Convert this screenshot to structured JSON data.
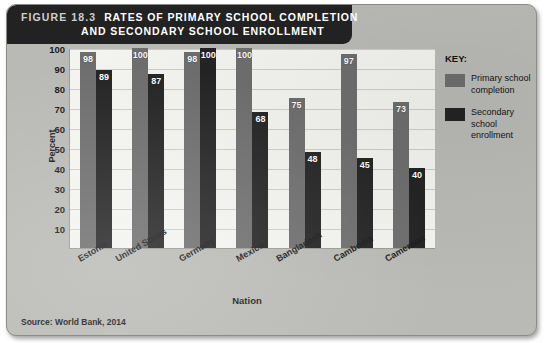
{
  "figure": {
    "number_label": "FIGURE 18.3",
    "title_line1": "RATES OF PRIMARY SCHOOL COMPLETION",
    "title_line2": "AND SECONDARY SCHOOL ENROLLMENT",
    "source": "Source: World Bank, 2014"
  },
  "legend": {
    "title": "KEY:",
    "items": [
      {
        "label": "Primary school completion",
        "color": "#6e6e6e",
        "swatch_name": "legend-swatch-primary"
      },
      {
        "label": "Secondary school enrollment",
        "color": "#242424",
        "swatch_name": "legend-swatch-secondary"
      }
    ]
  },
  "chart_data": {
    "type": "bar",
    "title": "RATES OF PRIMARY SCHOOL COMPLETION AND SECONDARY SCHOOL ENROLLMENT",
    "xlabel": "Nation",
    "ylabel": "Percent",
    "ylim": [
      0,
      100
    ],
    "yticks": [
      100,
      90,
      80,
      70,
      60,
      50,
      40,
      30,
      20,
      10
    ],
    "grid": true,
    "legend_position": "right",
    "categories": [
      "Estonia",
      "United States",
      "Germany",
      "Mexico",
      "Bangladesh",
      "Cambodia",
      "Cameroon"
    ],
    "series": [
      {
        "name": "Primary school completion",
        "color": "#6e6e6e",
        "values": [
          98,
          100,
          98,
          100,
          75,
          97,
          73
        ]
      },
      {
        "name": "Secondary school enrollment",
        "color": "#242424",
        "values": [
          89,
          87,
          100,
          68,
          48,
          45,
          40
        ]
      }
    ]
  }
}
